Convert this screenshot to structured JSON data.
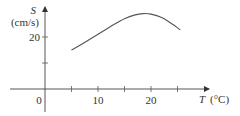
{
  "chart_data": {
    "type": "line",
    "title": "",
    "xlabel": "T (°C)",
    "ylabel": "S (cm/s)",
    "ylabel_symbol": "S",
    "ylabel_unit": "(cm/s)",
    "xlabel_symbol": "T",
    "xlabel_unit": "(°C)",
    "origin_label": "0",
    "x_ticks": [
      5,
      10,
      15,
      20,
      25
    ],
    "x_tick_labels": [
      "10",
      "20"
    ],
    "x_tick_labels_at": [
      10,
      20
    ],
    "y_ticks": [
      10,
      20
    ],
    "y_tick_labels": [
      "20"
    ],
    "y_tick_labels_at": [
      20
    ],
    "xlim": [
      -8,
      31
    ],
    "ylim": [
      -10,
      31
    ],
    "grid": false,
    "legend": null,
    "series": [
      {
        "name": "S(T)",
        "x": [
          5,
          7,
          9,
          11,
          13,
          15,
          17,
          18.5,
          20,
          22,
          24,
          25.5
        ],
        "y": [
          15,
          17.3,
          19.8,
          22.3,
          24.8,
          27,
          28.5,
          29,
          28.8,
          27.5,
          25,
          22.8
        ]
      }
    ]
  }
}
